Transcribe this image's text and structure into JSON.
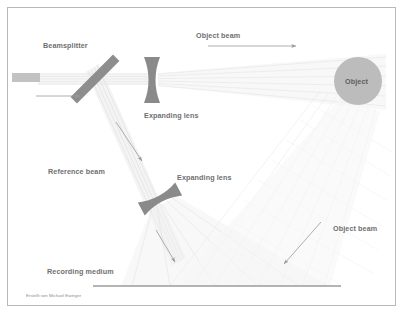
{
  "diagram": {
    "background_color": "#ffffff",
    "frame_color": "#b8b8b8",
    "label_color": "#6f6f6f",
    "beam_color": "#e2e2e2",
    "optic_color": "#8a8a8a",
    "arrow_color": "#9a9a9a",
    "object_fill": "#bcbcbc"
  },
  "labels": {
    "beamsplitter": "Beamsplitter",
    "object_beam_top": "Object beam",
    "object_beam_bottom": "Object beam",
    "expanding_lens_1": "Expanding lens",
    "expanding_lens_2": "Expanding lens",
    "reference_beam": "Reference beam",
    "recording_medium": "Recording medium",
    "object": "Object"
  },
  "credit": {
    "text": "Erstellt von Michael Ewinger"
  },
  "components": [
    {
      "name": "laser-source",
      "type": "rectangle",
      "x": 12,
      "y": 73,
      "width": 28,
      "height": 9,
      "fill": "#c2c2c2"
    },
    {
      "name": "beamsplitter",
      "type": "tilted-bar",
      "x1": 74,
      "y1": 58,
      "x2": 116,
      "y2": 100,
      "thickness": 9,
      "fill": "#8d8d8d"
    },
    {
      "name": "expanding-lens-1",
      "type": "biconcave-lens",
      "cx": 152,
      "cy": 80,
      "half_height": 23,
      "half_width": 6,
      "rotation": 0,
      "fill": "#8d8d8d"
    },
    {
      "name": "expanding-lens-2",
      "type": "biconcave-lens",
      "cx": 160,
      "cy": 199,
      "half_height": 21,
      "half_width": 5,
      "rotation": 62,
      "fill": "#8d8d8d"
    },
    {
      "name": "object",
      "type": "circle",
      "cx": 358,
      "cy": 81,
      "r": 24,
      "fill": "#bcbcbc"
    },
    {
      "name": "recording-medium",
      "type": "line",
      "x1": 93,
      "y1": 286,
      "x2": 341,
      "y2": 286,
      "stroke": "#9b9b9b",
      "stroke_width": 1.2
    }
  ],
  "annotation_arrows": [
    {
      "name": "input-beam-arrow",
      "x1": 36,
      "y1": 96,
      "x2": 82,
      "y2": 96
    },
    {
      "name": "object-beam-top-arrow",
      "x1": 208,
      "y1": 46,
      "x2": 298,
      "y2": 46
    },
    {
      "name": "reference-beam-arrow",
      "x1": 116,
      "y1": 122,
      "x2": 143,
      "y2": 162
    },
    {
      "name": "reference-down-arrow",
      "x1": 157,
      "y1": 230,
      "x2": 176,
      "y2": 263
    },
    {
      "name": "object-beam-bottom-arrow",
      "x1": 321,
      "y1": 222,
      "x2": 283,
      "y2": 265
    }
  ]
}
